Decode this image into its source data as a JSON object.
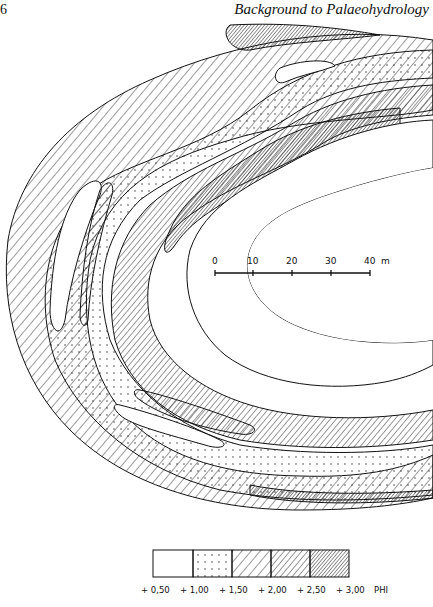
{
  "header": {
    "page_number": "6",
    "running_title": "Background to Palaeohydrology"
  },
  "figure": {
    "scale_bar": {
      "ticks": [
        "0",
        "10",
        "20",
        "30",
        "40"
      ],
      "unit": "m"
    },
    "legend": {
      "unit": "PHI",
      "boundaries": [
        "+0.50",
        "+1.00",
        "+1.50",
        "+2.00",
        "+2.50",
        "+3.00"
      ],
      "boundary_labels": [
        "+ 0,50",
        "+ 1,00",
        "+ 1,50",
        "+ 2,00",
        "+ 2,50",
        "+ 3,00"
      ],
      "classes": [
        {
          "range": "+0.50 to +1.00",
          "pattern": "blank"
        },
        {
          "range": "+1.00 to +1.50",
          "pattern": "dots"
        },
        {
          "range": "+1.50 to +2.00",
          "pattern": "wide-hatch"
        },
        {
          "range": "+2.00 to +2.50",
          "pattern": "medium-hatch"
        },
        {
          "range": "+2.50 to +3.00",
          "pattern": "dense-hatch"
        }
      ]
    }
  }
}
